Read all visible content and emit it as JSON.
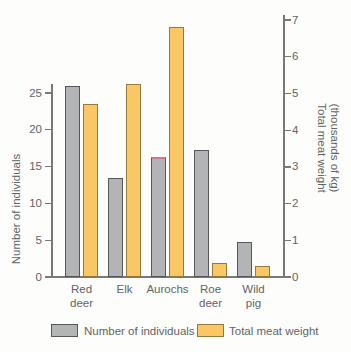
{
  "chart_data": {
    "type": "bar",
    "title": "",
    "categories": [
      "Red deer",
      "Elk",
      "Aurochs",
      "Roe deer",
      "Wild pig"
    ],
    "category_label_lines": [
      [
        "Red",
        "deer"
      ],
      [
        "Elk"
      ],
      [
        "Aurochs"
      ],
      [
        "Roe",
        "deer"
      ],
      [
        "Wild",
        "pig"
      ]
    ],
    "series": [
      {
        "name": "Number of individuals",
        "axis": "left",
        "fill": "#b3b4b6",
        "stroke": "#56575b",
        "values": [
          26,
          13.5,
          16.3,
          17.3,
          4.7
        ]
      },
      {
        "name": "Total meat weight",
        "axis": "right",
        "fill": "#f9c765",
        "stroke": "#97783e",
        "values": [
          4.7,
          5.25,
          6.8,
          0.38,
          0.3
        ]
      }
    ],
    "left_axis": {
      "title": "Number of individuals",
      "ticks": [
        0,
        5,
        10,
        15,
        20,
        25
      ],
      "range": [
        0,
        26.3
      ]
    },
    "right_axis": {
      "title_line1": "Total meat weight",
      "title_line2": "(thousands of kg)",
      "ticks": [
        0,
        1,
        2,
        3,
        4,
        5,
        6,
        7
      ],
      "range": [
        0,
        7.15
      ]
    },
    "legend": [
      "Number of individuals",
      "Total meat weight"
    ],
    "annotation": {
      "aurochs_bar_top_tint": "#c97f8a"
    },
    "layout": {
      "grid": false,
      "legend_position": "bottom"
    }
  }
}
